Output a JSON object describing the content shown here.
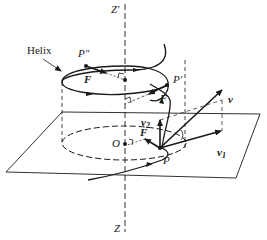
{
  "figure": {
    "labels": {
      "helix": "Helix",
      "axis_top": "Z'",
      "axis_bottom": "Z",
      "point_P": "P",
      "point_P_prime": "P'",
      "point_P_double_prime": "P\"",
      "origin": "O",
      "force_upper": "F",
      "force_middle": "F",
      "force_lower": "F",
      "velocity": "v",
      "velocity_2": "v",
      "velocity_2_sub": "2",
      "velocity_1": "v",
      "velocity_1_sub": "1"
    },
    "colors": {
      "ink": "#1a1a1a",
      "background": "#ffffff"
    }
  }
}
